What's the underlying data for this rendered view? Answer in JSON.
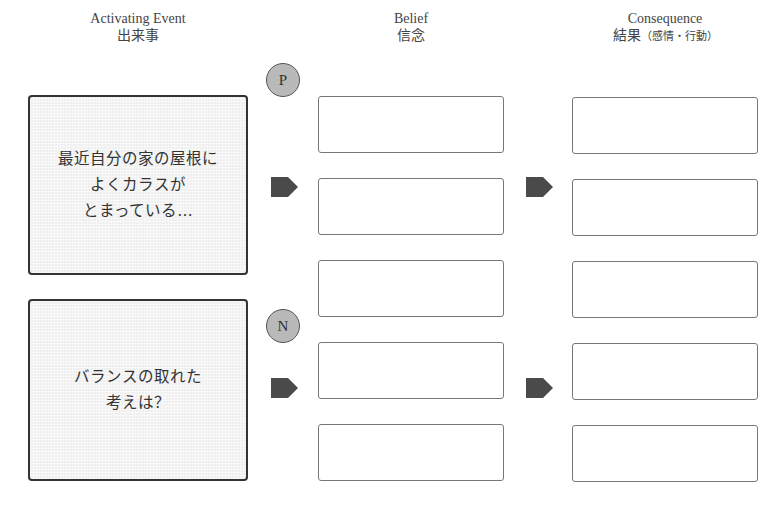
{
  "headers": {
    "activating_event": {
      "en": "Activating Event",
      "jp": "出来事"
    },
    "belief": {
      "en": "Belief",
      "jp": "信念"
    },
    "consequence": {
      "en": "Consequence",
      "jp": "結果",
      "jp_sub": "（感情・行動）"
    }
  },
  "events": [
    {
      "lines": [
        "最近自分の家の屋根に",
        "よくカラスが",
        "とまっている…"
      ]
    },
    {
      "lines": [
        "バランスの取れた",
        "考えは？"
      ]
    }
  ],
  "markers": {
    "positive": "P",
    "negative": "N"
  },
  "belief_boxes": [
    "",
    "",
    "",
    "",
    ""
  ],
  "consequence_boxes": [
    "",
    "",
    "",
    "",
    ""
  ],
  "colors": {
    "arrow": "#4a4a4a",
    "circle": "#b9b9b9",
    "event_bg": "#efefef"
  }
}
